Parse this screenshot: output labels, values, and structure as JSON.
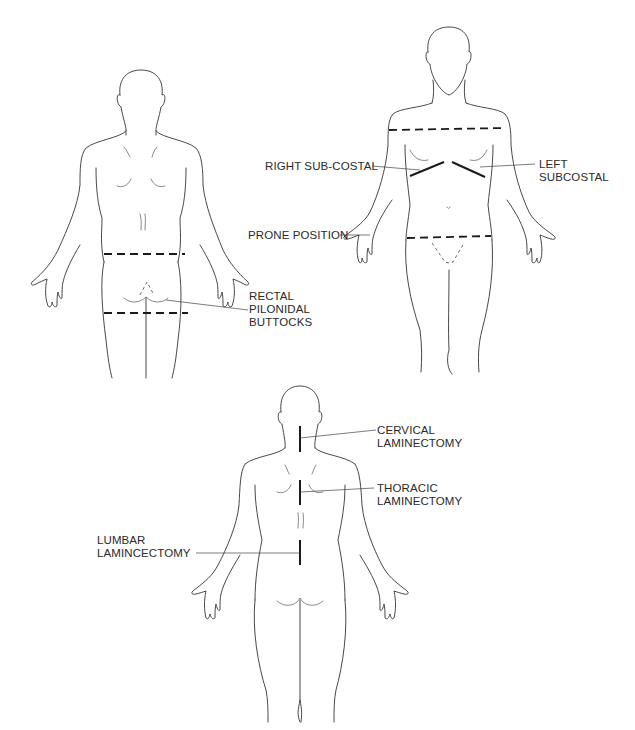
{
  "figures": {
    "posterior_lower": {
      "labels": {
        "rectal": "RECTAL",
        "pilonidal": "PILONIDAL",
        "buttocks": "BUTTOCKS"
      }
    },
    "anterior": {
      "labels": {
        "right_subcostal": "RIGHT SUB-COSTAL",
        "left_subcostal_1": "LEFT",
        "left_subcostal_2": "SUBCOSTAL",
        "prone_position": "PRONE POSITION"
      }
    },
    "posterior_spine": {
      "labels": {
        "cervical_1": "CERVICAL",
        "cervical_2": "LAMINECTOMY",
        "thoracic_1": "THORACIC",
        "thoracic_2": "LAMINECTOMY",
        "lumbar_1": "LUMBAR",
        "lumbar_2": "LAMINCECTOMY"
      }
    }
  },
  "colors": {
    "line": "#333333",
    "incision": "#1a1a1a",
    "background": "#ffffff"
  }
}
